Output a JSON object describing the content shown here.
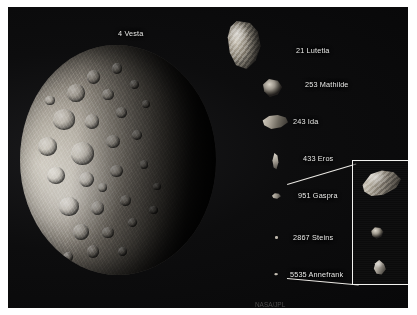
{
  "figure": {
    "caption_visible": false,
    "background_color": "#0a0a0b",
    "label_color": "#e8e8e6",
    "inset_border_color": "#f2f2ef"
  },
  "objects": [
    {
      "key": "vesta",
      "label": "4 Vesta",
      "icon": "asteroid-vesta-icon"
    },
    {
      "key": "lutetia",
      "label": "21 Lutetia",
      "icon": "asteroid-lutetia-icon"
    },
    {
      "key": "mathilde",
      "label": "253 Mathilde",
      "icon": "asteroid-mathilde-icon"
    },
    {
      "key": "ida",
      "label": "243 Ida",
      "icon": "asteroid-ida-icon"
    },
    {
      "key": "eros",
      "label": "433 Eros",
      "icon": "asteroid-eros-icon"
    },
    {
      "key": "gaspra",
      "label": "951 Gaspra",
      "icon": "asteroid-gaspra-icon"
    },
    {
      "key": "steins",
      "label": "2867 Steins",
      "icon": "asteroid-steins-icon"
    },
    {
      "key": "annefrank",
      "label": "5535 Annefrank",
      "icon": "asteroid-annefrank-icon"
    }
  ],
  "inset": {
    "name": "magnified-inset",
    "contains": [
      "951 Gaspra",
      "2867 Steins",
      "5535 Annefrank"
    ]
  },
  "credit": {
    "text": "NASA/JPL"
  }
}
